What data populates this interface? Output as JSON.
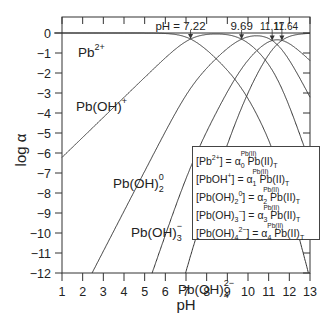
{
  "chart_data": {
    "type": "line",
    "title": "",
    "xlabel": "pH",
    "ylabel": "log α",
    "xlim": [
      1,
      13
    ],
    "ylim": [
      -12,
      0
    ],
    "x_ticks": [
      "1",
      "2",
      "3",
      "4",
      "5",
      "6",
      "7",
      "8",
      "9",
      "10",
      "11",
      "12",
      "13"
    ],
    "y_ticks": [
      "0",
      "−1",
      "−2",
      "−3",
      "−4",
      "−5",
      "−6",
      "−7",
      "−8",
      "−9",
      "−10",
      "−11",
      "−12"
    ],
    "grid": false,
    "pK_crossings": [
      7.22,
      9.69,
      11.17,
      11.64
    ],
    "crossing_labels": [
      "pH = 7.22",
      "9.69",
      "11.17",
      "11.64"
    ],
    "series": [
      {
        "name": "Pb2+",
        "label": "Pb",
        "sup": "2+",
        "sub": "",
        "n": 0
      },
      {
        "name": "Pb(OH)+",
        "label": "Pb(OH)",
        "sup": "+",
        "sub": "",
        "n": 1
      },
      {
        "name": "Pb(OH)2 0",
        "label": "Pb(OH)",
        "sup": "0",
        "sub": "2",
        "n": 2
      },
      {
        "name": "Pb(OH)3-",
        "label": "Pb(OH)",
        "sup": "−",
        "sub": "3",
        "n": 3
      },
      {
        "name": "Pb(OH)4 2-",
        "label": "Pb(OH)",
        "sup": "2−",
        "sub": "4",
        "n": 4
      }
    ],
    "sample_points": {
      "Pb2+": [
        [
          1,
          0
        ],
        [
          5,
          -0.01
        ],
        [
          7.22,
          -0.3
        ],
        [
          9,
          -2.0
        ],
        [
          11,
          -5.5
        ],
        [
          13,
          -12.3
        ]
      ],
      "Pb(OH)+": [
        [
          1,
          -6.22
        ],
        [
          4,
          -3.22
        ],
        [
          7.22,
          -0.3
        ],
        [
          9.69,
          -2.6
        ],
        [
          12,
          -7.4
        ]
      ],
      "Pb(OH)2 0": [
        [
          2.45,
          -12
        ],
        [
          5,
          -6.9
        ],
        [
          7.22,
          -2.7
        ],
        [
          9.69,
          -0.8
        ],
        [
          11.17,
          -1.4
        ],
        [
          13,
          -5.0
        ]
      ],
      "Pb(OH)3-": [
        [
          5.36,
          -12
        ],
        [
          7,
          -7.1
        ],
        [
          9.69,
          -1.6
        ],
        [
          11.17,
          -1.4
        ],
        [
          13,
          -3.0
        ]
      ],
      "Pb(OH)4 2-": [
        [
          6.93,
          -12
        ],
        [
          9,
          -3.8
        ],
        [
          11.64,
          -1.1
        ],
        [
          13,
          -1.0
        ]
      ]
    },
    "legend_position": "inside lower right",
    "legend": [
      {
        "lhs_base": "[Pb",
        "lhs_sup": "2+",
        "lhs_sub": "",
        "lhs_close": "]",
        "alpha_idx": "0"
      },
      {
        "lhs_base": "[PbOH",
        "lhs_sup": "+",
        "lhs_sub": "",
        "lhs_close": "]",
        "alpha_idx": "1"
      },
      {
        "lhs_base": "[Pb(OH)",
        "lhs_sub": "2",
        "lhs_sup": "0",
        "lhs_close": "]",
        "alpha_idx": "2"
      },
      {
        "lhs_base": "[Pb(OH)",
        "lhs_sub": "3",
        "lhs_sup": "−",
        "lhs_close": "]",
        "alpha_idx": "3"
      },
      {
        "lhs_base": "[Pb(OH)",
        "lhs_sub": "4",
        "lhs_sup": "2−",
        "lhs_close": "]",
        "alpha_idx": "4"
      }
    ],
    "legend_rhs": {
      "eq": " = ",
      "alpha": "α",
      "alpha_sup": "Pb(II)",
      "total": " Pb(II)",
      "total_sub": "T"
    }
  },
  "axes": {
    "x_label": "pH",
    "y_label": "log α"
  }
}
